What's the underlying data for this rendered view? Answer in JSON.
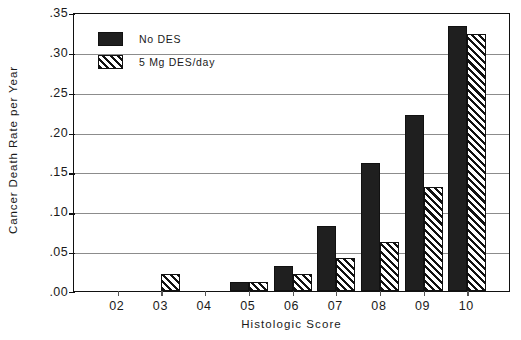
{
  "chart_data": {
    "type": "bar",
    "title": "",
    "xlabel": "Histologic Score",
    "ylabel": "Cancer Death Rate per Year",
    "categories": [
      "02",
      "03",
      "04",
      "05",
      "06",
      "07",
      "08",
      "09",
      "10"
    ],
    "series": [
      {
        "name": "No DES",
        "style": "solid",
        "values": [
          0.0,
          0.0,
          0.0,
          0.011,
          0.031,
          0.081,
          0.161,
          0.221,
          0.333
        ]
      },
      {
        "name": "5 Mg DES/day",
        "style": "hatch",
        "values": [
          0.0,
          0.021,
          0.0,
          0.011,
          0.021,
          0.041,
          0.061,
          0.131,
          0.322
        ]
      }
    ],
    "ylim": [
      0.0,
      0.35
    ],
    "ytick_labels": [
      ".00",
      ".05",
      ".10",
      ".15",
      ".20",
      ".25",
      ".30",
      ".35"
    ],
    "ytick_values": [
      0.0,
      0.05,
      0.1,
      0.15,
      0.2,
      0.25,
      0.3,
      0.35
    ],
    "grid": true,
    "legend_position": "top-left"
  },
  "legend": {
    "entries": [
      {
        "label": "No DES",
        "swatch": "solid-black-swatch"
      },
      {
        "label": "5 Mg DES/day",
        "swatch": "diagonal-hatch-swatch"
      }
    ]
  },
  "colors": {
    "solid_fill": "#1f1f1f",
    "hatch_line": "#111111",
    "hatch_background": "#ffffff",
    "axis": "#111111",
    "gridline": "#8c8c8c",
    "background": "#ffffff",
    "text": "#1a1a1a"
  }
}
